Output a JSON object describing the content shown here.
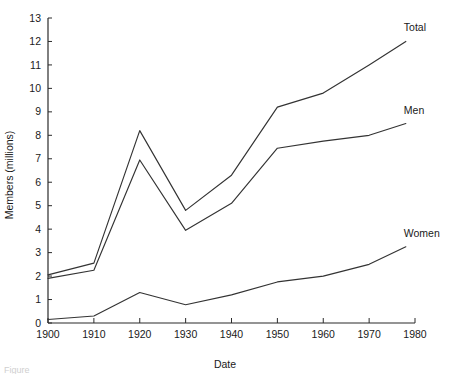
{
  "chart_data": {
    "type": "line",
    "title": "",
    "xlabel": "Date",
    "ylabel": "Members (millions)",
    "xlim": [
      1900,
      1980
    ],
    "ylim": [
      0,
      13
    ],
    "grid": false,
    "legend_position": "right-inline-labels",
    "x": [
      1900,
      1910,
      1920,
      1930,
      1940,
      1950,
      1960,
      1970,
      1978
    ],
    "xticks": [
      "1900",
      "1910",
      "1920",
      "1930",
      "1940",
      "1950",
      "1960",
      "1970",
      "1980"
    ],
    "yticks": [
      "0",
      "1",
      "2",
      "3",
      "4",
      "5",
      "6",
      "7",
      "8",
      "9",
      "10",
      "11",
      "12",
      "13"
    ],
    "series": [
      {
        "name": "Total",
        "values": [
          2.05,
          2.55,
          8.2,
          4.8,
          6.3,
          9.2,
          9.8,
          11.0,
          12.0
        ]
      },
      {
        "name": "Men",
        "values": [
          1.9,
          2.25,
          6.95,
          3.95,
          5.1,
          7.45,
          7.75,
          8.0,
          8.5
        ]
      },
      {
        "name": "Women",
        "values": [
          0.15,
          0.3,
          1.3,
          0.78,
          1.2,
          1.75,
          2.0,
          2.5,
          3.25
        ]
      }
    ]
  },
  "labels": {
    "total": "Total",
    "men": "Men",
    "women": "Women"
  },
  "caption": {
    "text": "Figure"
  }
}
